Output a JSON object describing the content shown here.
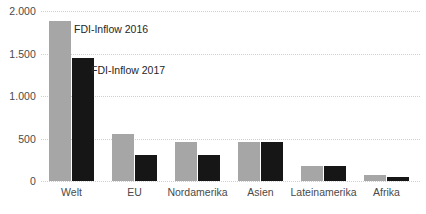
{
  "chart_data": {
    "type": "bar",
    "title": "",
    "subtitle": "",
    "xlabel": "",
    "ylabel": "",
    "ylim": [
      0,
      2000
    ],
    "yticks": [
      "0",
      "500",
      "1.000",
      "1.500",
      "2.000"
    ],
    "ytick_values": [
      0,
      500,
      1000,
      1500,
      2000
    ],
    "grid": true,
    "legend_position": "inline-annotation",
    "categories": [
      "Welt",
      "EU",
      "Nordamerika",
      "Asien",
      "Lateinamerika",
      "Afrika"
    ],
    "series": [
      {
        "name": "FDI-Inflow 2016",
        "color": "#a6a6a6",
        "values": [
          1880,
          550,
          460,
          455,
          175,
          70
        ]
      },
      {
        "name": "FDI-Inflow 2017",
        "color": "#161616",
        "values": [
          1450,
          305,
          305,
          455,
          175,
          45
        ]
      }
    ],
    "annotations": [
      {
        "text": "FDI-Inflow 2016",
        "series": "FDI-Inflow 2016"
      },
      {
        "text": "FDI-Inflow 2017",
        "series": "FDI-Inflow 2017"
      }
    ]
  }
}
